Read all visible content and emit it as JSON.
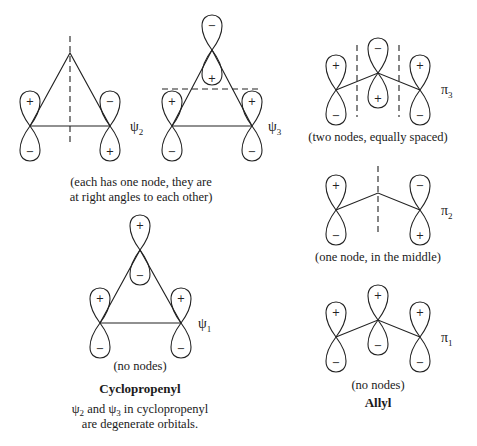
{
  "figure": {
    "cyclopropenyl": {
      "title": "Cyclopropenyl",
      "psi2": {
        "label": "ψ",
        "subscript": "2",
        "nodes": "vertical through apex",
        "signs": {
          "left_top": "+",
          "left_bottom": "−",
          "right_top": "−",
          "right_bottom": "+"
        }
      },
      "psi3": {
        "label": "ψ",
        "subscript": "3",
        "nodes": "horizontal",
        "signs": {
          "apex_top": "−",
          "apex_bottom": "+",
          "left_top": "+",
          "left_bottom": "−",
          "right_top": "+",
          "right_bottom": "−"
        }
      },
      "degenerate_caption_line1": "(each has one node, they are",
      "degenerate_caption_line2": "at right angles to each other)",
      "psi1": {
        "label": "ψ",
        "subscript": "1",
        "signs": {
          "apex_top": "+",
          "apex_bottom": "−",
          "left_top": "+",
          "left_bottom": "−",
          "right_top": "+",
          "right_bottom": "−"
        }
      },
      "psi1_caption": "(no nodes)",
      "note_line1_a": "ψ",
      "note_line1_sub_a": "2",
      "note_line1_mid": " and ",
      "note_line1_b": "ψ",
      "note_line1_sub_b": "3",
      "note_line1_end": " in cyclopropenyl",
      "note_line2": "are degenerate orbitals."
    },
    "allyl": {
      "title": "Allyl",
      "pi3": {
        "label": "π",
        "subscript": "3",
        "caption": "(two nodes, equally spaced)",
        "signs": {
          "left_top": "+",
          "left_bottom": "−",
          "mid_top": "−",
          "mid_bottom": "+",
          "right_top": "+",
          "right_bottom": "−"
        }
      },
      "pi2": {
        "label": "π",
        "subscript": "2",
        "caption": "(one node, in the middle)",
        "signs": {
          "left_top": "+",
          "left_bottom": "−",
          "right_top": "−",
          "right_bottom": "+"
        }
      },
      "pi1": {
        "label": "π",
        "subscript": "1",
        "caption": "(no nodes)",
        "signs": {
          "left_top": "+",
          "left_bottom": "−",
          "mid_top": "+",
          "mid_bottom": "−",
          "right_top": "+",
          "right_bottom": "−"
        }
      }
    }
  }
}
